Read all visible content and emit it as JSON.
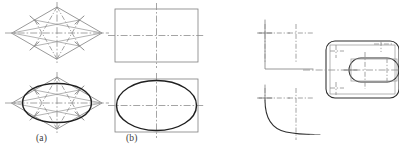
{
  "figure": {
    "kind": "technical-drawing",
    "background_color": "#ffffff",
    "ink_color": "#2e2e2e",
    "construction_color": "#8d8d8d",
    "centerline_color": "#9a9a9a",
    "faint_color": "#d8d8d8"
  },
  "captions": {
    "a": "(a)",
    "b": "(b)"
  },
  "bottom_clipped_text": {
    "left": "",
    "right": ""
  },
  "panels": [
    {
      "id": "panel-a-top",
      "name": "rhombus-construction",
      "label": "(a)",
      "shape": "rhombus",
      "has_centerlines": true,
      "has_construction_ticks": true,
      "has_ellipse": false
    },
    {
      "id": "panel-a-bottom",
      "name": "rhombus-inscribed-ellipse",
      "label": "(a)",
      "shape": "rhombus",
      "has_centerlines": true,
      "has_construction_ticks": true,
      "has_ellipse": true
    },
    {
      "id": "panel-b-top",
      "name": "rectangle-construction",
      "label": "(b)",
      "shape": "rectangle",
      "has_centerlines": true,
      "has_construction_ticks": false,
      "has_ellipse": false
    },
    {
      "id": "panel-b-bottom",
      "name": "rectangle-inscribed-ellipse",
      "label": "(b)",
      "shape": "rectangle",
      "has_centerlines": true,
      "has_construction_ticks": false,
      "has_ellipse": true
    },
    {
      "id": "panel-corner-top",
      "name": "square-corner-centerlines",
      "label": "",
      "shape": "corner",
      "has_centerlines": true,
      "has_construction_ticks": true,
      "has_ellipse": false
    },
    {
      "id": "panel-corner-bottom",
      "name": "corner-fillet-curve",
      "label": "",
      "shape": "corner-with-fillet",
      "has_centerlines": true,
      "has_construction_ticks": true,
      "has_ellipse": false
    },
    {
      "id": "panel-rounded",
      "name": "rounded-rectangle-with-slot",
      "label": "",
      "shape": "rounded-rectangle",
      "has_centerlines": true,
      "has_construction_ticks": true,
      "has_ellipse": false
    }
  ]
}
